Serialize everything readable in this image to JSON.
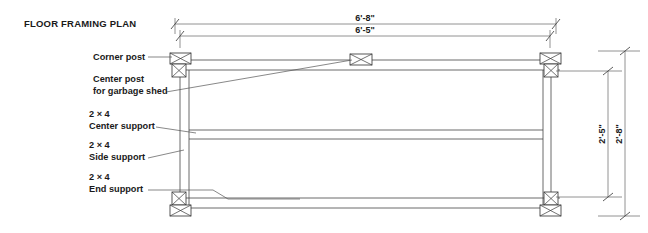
{
  "drawing": {
    "title": "FLOOR FRAMING PLAN",
    "type": "architectural-framing-plan"
  },
  "callouts": [
    {
      "id": "corner-post",
      "lines": [
        "Corner post"
      ]
    },
    {
      "id": "center-post",
      "lines": [
        "Center post",
        "for garbage shed"
      ]
    },
    {
      "id": "center-support",
      "lines": [
        "2 × 4",
        "Center support"
      ]
    },
    {
      "id": "side-support",
      "lines": [
        "2 × 4",
        "Side support"
      ]
    },
    {
      "id": "end-support",
      "lines": [
        "2 × 4",
        "End support"
      ]
    }
  ],
  "dimensions": {
    "top_outer": "6'-8\"",
    "top_inner": "6'-5\"",
    "right_inner": "2'-5\"",
    "right_outer": "2'-8\""
  },
  "colors": {
    "paper": "#ffffff",
    "line": "#4a4a4a",
    "text": "#1a1a1a"
  }
}
